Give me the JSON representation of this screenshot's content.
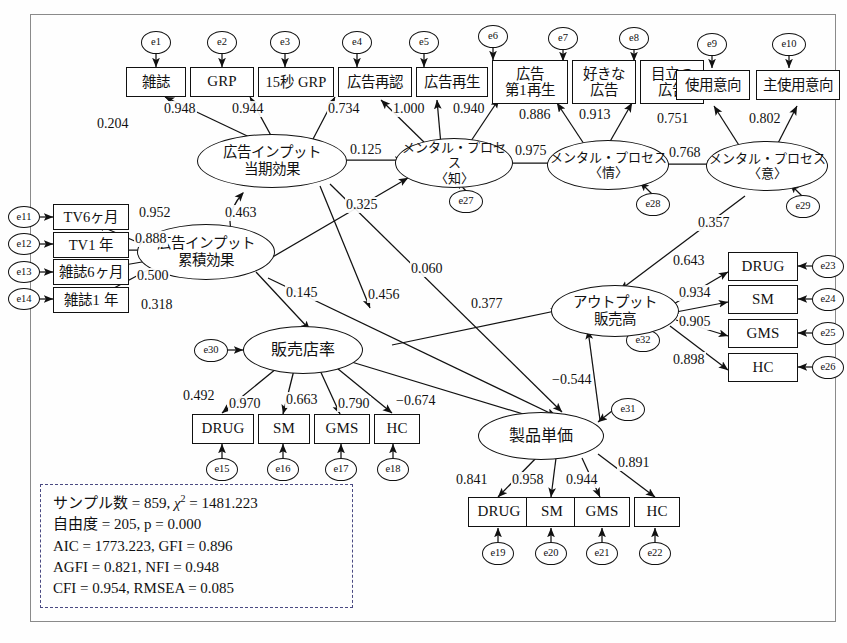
{
  "diagram": {
    "latent": [
      {
        "id": "ad_input_current",
        "label_line1": "広告インプット",
        "label_line2": "当期効果"
      },
      {
        "id": "ad_input_cumulative",
        "label_line1": "広告インプット",
        "label_line2": "累積効果"
      },
      {
        "id": "mental_cognition",
        "label_line1": "メンタル・プロセス",
        "label_line2": "〈知〉"
      },
      {
        "id": "mental_affect",
        "label_line1": "メンタル・プロセス",
        "label_line2": "〈情〉"
      },
      {
        "id": "mental_intention",
        "label_line1": "メンタル・プロセス",
        "label_line2": "〈意〉"
      },
      {
        "id": "store_rate",
        "label_line1": "販売店率",
        "label_line2": ""
      },
      {
        "id": "output_sales",
        "label_line1": "アウトプット",
        "label_line2": "販売高"
      },
      {
        "id": "unit_price",
        "label_line1": "製品単価",
        "label_line2": ""
      }
    ],
    "observed": [
      {
        "id": "magazine",
        "label_line1": "雑誌",
        "label_line2": ""
      },
      {
        "id": "grp",
        "label_line1": "GRP",
        "label_line2": ""
      },
      {
        "id": "grp15",
        "label_line1": "15秒 GRP",
        "label_line2": ""
      },
      {
        "id": "ad_recognition",
        "label_line1": "広告再認",
        "label_line2": ""
      },
      {
        "id": "ad_recall",
        "label_line1": "広告再生",
        "label_line2": ""
      },
      {
        "id": "ad_first_recall",
        "label_line1": "広告",
        "label_line2": "第1再生"
      },
      {
        "id": "liked_ad",
        "label_line1": "好きな",
        "label_line2": "広告"
      },
      {
        "id": "notable_ad",
        "label_line1": "目立つ",
        "label_line2": "広告"
      },
      {
        "id": "use_intent",
        "label_line1": "使用意向",
        "label_line2": ""
      },
      {
        "id": "main_use_intent",
        "label_line1": "主使用意向",
        "label_line2": ""
      },
      {
        "id": "tv6m",
        "label_line1": "TV6ヶ月",
        "label_line2": ""
      },
      {
        "id": "tv1y",
        "label_line1": "TV1 年",
        "label_line2": ""
      },
      {
        "id": "mag6m",
        "label_line1": "雑誌6ヶ月",
        "label_line2": ""
      },
      {
        "id": "mag1y",
        "label_line1": "雑誌1 年",
        "label_line2": ""
      },
      {
        "id": "sales_drug",
        "label_line1": "DRUG",
        "label_line2": ""
      },
      {
        "id": "sales_sm",
        "label_line1": "SM",
        "label_line2": ""
      },
      {
        "id": "sales_gms",
        "label_line1": "GMS",
        "label_line2": ""
      },
      {
        "id": "sales_hc",
        "label_line1": "HC",
        "label_line2": ""
      },
      {
        "id": "price_drug",
        "label_line1": "DRUG",
        "label_line2": ""
      },
      {
        "id": "price_sm",
        "label_line1": "SM",
        "label_line2": ""
      },
      {
        "id": "price_gms",
        "label_line1": "GMS",
        "label_line2": ""
      },
      {
        "id": "price_hc",
        "label_line1": "HC",
        "label_line2": ""
      },
      {
        "id": "out_drug",
        "label_line1": "DRUG",
        "label_line2": ""
      },
      {
        "id": "out_sm",
        "label_line1": "SM",
        "label_line2": ""
      },
      {
        "id": "out_gms",
        "label_line1": "GMS",
        "label_line2": ""
      },
      {
        "id": "out_hc",
        "label_line1": "HC",
        "label_line2": ""
      }
    ],
    "errors": [
      {
        "id": "e1",
        "label": "e1"
      },
      {
        "id": "e2",
        "label": "e2"
      },
      {
        "id": "e3",
        "label": "e3"
      },
      {
        "id": "e4",
        "label": "e4"
      },
      {
        "id": "e5",
        "label": "e5"
      },
      {
        "id": "e6",
        "label": "e6"
      },
      {
        "id": "e7",
        "label": "e7"
      },
      {
        "id": "e8",
        "label": "e8"
      },
      {
        "id": "e9",
        "label": "e9"
      },
      {
        "id": "e10",
        "label": "e10"
      },
      {
        "id": "e11",
        "label": "e11"
      },
      {
        "id": "e12",
        "label": "e12"
      },
      {
        "id": "e13",
        "label": "e13"
      },
      {
        "id": "e14",
        "label": "e14"
      },
      {
        "id": "e15",
        "label": "e15"
      },
      {
        "id": "e16",
        "label": "e16"
      },
      {
        "id": "e17",
        "label": "e17"
      },
      {
        "id": "e18",
        "label": "e18"
      },
      {
        "id": "e19",
        "label": "e19"
      },
      {
        "id": "e20",
        "label": "e20"
      },
      {
        "id": "e21",
        "label": "e21"
      },
      {
        "id": "e22",
        "label": "e22"
      },
      {
        "id": "e23",
        "label": "e23"
      },
      {
        "id": "e24",
        "label": "e24"
      },
      {
        "id": "e25",
        "label": "e25"
      },
      {
        "id": "e26",
        "label": "e26"
      },
      {
        "id": "e27",
        "label": "e27"
      },
      {
        "id": "e28",
        "label": "e28"
      },
      {
        "id": "e29",
        "label": "e29"
      },
      {
        "id": "e30",
        "label": "e30"
      },
      {
        "id": "e31",
        "label": "e31"
      },
      {
        "id": "e32",
        "label": "e32"
      }
    ],
    "coefficients": {
      "c_ad_magazine": "0.204",
      "c_ad_grp": "0.948",
      "c_ad_grp15": "0.944",
      "c_cog_recognition": "0.734",
      "c_cog_recall": "1.000",
      "c_cog_first_recall": "0.940",
      "c_aff_liked": "0.886",
      "c_aff_notable": "0.913",
      "c_int_use": "0.751",
      "c_int_main_use": "0.802",
      "c_adcur_cog": "0.125",
      "c_cog_aff": "0.975",
      "c_aff_int": "0.768",
      "c_cum_tv6m": "0.952",
      "c_cum_tv1y": "0.888",
      "c_cum_mag6m": "0.500",
      "c_cum_mag1y": "0.318",
      "c_cur_cum_corr": "0.463",
      "c_cum_cog": "0.325",
      "c_cum_store": "0.145",
      "c_cur_store": "0.456",
      "c_cur_price": "0.060",
      "c_store_output": "0.377",
      "c_int_output": "0.357",
      "c_store_drug": "0.492",
      "c_store_sm": "0.970",
      "c_store_gms": "0.663",
      "c_store_hc": "0.790",
      "c_store_price": "−0.674",
      "c_price_output": "−0.544",
      "c_out_drug": "0.643",
      "c_out_sm": "0.934",
      "c_out_gms": "0.905",
      "c_out_hc": "0.898",
      "c_price_drug": "0.841",
      "c_price_sm": "0.958",
      "c_price_gms": "0.944",
      "c_price_hc": "0.891"
    },
    "fit_statistics": {
      "line1_a": "サンプル数 = 859,",
      "line1_chi": "χ",
      "line1_sup": "2",
      "line1_b": "= 1481.223",
      "line2": "自由度 = 205,  p = 0.000",
      "line3": "AIC = 1773.223,  GFI = 0.896",
      "line4": "AGFI = 0.821,  NFI = 0.948",
      "line5": "CFI = 0.954,  RMSEA = 0.085"
    }
  }
}
